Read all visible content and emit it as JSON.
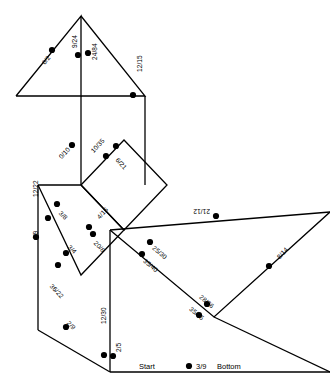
{
  "figure": {
    "stroke_color": "#000000",
    "fill_color": "#ffffff",
    "dot_color": "#000000",
    "width": 330,
    "height": 383
  },
  "polylines": [
    {
      "name": "top-large-triangle-left",
      "points": "16,96 81,16 81,96 16,96"
    },
    {
      "name": "top-large-triangle-right",
      "points": "81,16 145,96 81,96"
    },
    {
      "name": "neck-vertical-left",
      "points": "81,96 81,185"
    },
    {
      "name": "neck-vertical-right",
      "points": "145,96 145,185"
    },
    {
      "name": "body-diamond",
      "points": "81,185 124,140 167,185 124,230 81,185"
    },
    {
      "name": "left-parallelogram",
      "points": "38,185 81,185 124,230 81,275 38,185"
    },
    {
      "name": "left-vertical",
      "points": "38,185 38,330"
    },
    {
      "name": "bottom-left-edge",
      "points": "38,330 110,372"
    },
    {
      "name": "bottom-baseline",
      "points": "110,372 330,372"
    },
    {
      "name": "body-vertical-center",
      "points": "110,230 110,372"
    },
    {
      "name": "right-wing-top",
      "points": "110,230 330,212"
    },
    {
      "name": "right-wing-diagonal",
      "points": "110,230 214,317 330,212"
    },
    {
      "name": "right-lower-edge",
      "points": "214,317 330,372"
    }
  ],
  "labels": [
    {
      "name": "label-6-2",
      "text": "6/2",
      "x": 41,
      "y": 62,
      "rot": -52,
      "dot_x": 52,
      "dot_y": 50
    },
    {
      "name": "label-9-24",
      "text": "9/24",
      "x": 72,
      "y": 48,
      "rot": -90,
      "dot_x": 78,
      "dot_y": 55
    },
    {
      "name": "label-24-84",
      "text": "24/84",
      "x": 92,
      "y": 60,
      "rot": -90,
      "dot_x": 88,
      "dot_y": 53
    },
    {
      "name": "label-12-15",
      "text": "12/15",
      "x": 137,
      "y": 72,
      "rot": -90,
      "dot_x": 133,
      "dot_y": 95
    },
    {
      "name": "label-0-10",
      "text": "0/10",
      "x": 58,
      "y": 156,
      "rot": -48,
      "dot_x": 72,
      "dot_y": 145
    },
    {
      "name": "label-10-35",
      "text": "10/35",
      "x": 90,
      "y": 150,
      "rot": -48,
      "dot_x": 106,
      "dot_y": 156
    },
    {
      "name": "label-6-21",
      "text": "6/21",
      "x": 119,
      "y": 157,
      "rot": 48,
      "dot_x": 116,
      "dot_y": 146
    },
    {
      "name": "label-12-22",
      "text": "12/22",
      "x": 33,
      "y": 197,
      "rot": -90,
      "dot_x": 48,
      "dot_y": 218
    },
    {
      "name": "label-3-8",
      "text": "3/8",
      "x": 62,
      "y": 210,
      "rot": 47,
      "dot_x": 57,
      "dot_y": 204
    },
    {
      "name": "label-4-16",
      "text": "4/16",
      "x": 96,
      "y": 216,
      "rot": -47,
      "dot_x": 89,
      "dot_y": 227
    },
    {
      "name": "label-4-9",
      "text": "4/9",
      "x": 33,
      "y": 240,
      "rot": -90,
      "dot_x": 36,
      "dot_y": 237
    },
    {
      "name": "label-3-4",
      "text": "3/4",
      "x": 71,
      "y": 244,
      "rot": 47,
      "dot_x": 66,
      "dot_y": 253
    },
    {
      "name": "label-20-8",
      "text": "20/8",
      "x": 97,
      "y": 240,
      "rot": 47,
      "dot_x": 93,
      "dot_y": 234
    },
    {
      "name": "label-36-22",
      "text": "36/22",
      "x": 53,
      "y": 283,
      "rot": 47,
      "dot_x": 58,
      "dot_y": 265
    },
    {
      "name": "label-2-9",
      "text": "2/9",
      "x": 70,
      "y": 320,
      "rot": 47,
      "dot_x": 66,
      "dot_y": 327
    },
    {
      "name": "label-12-30",
      "text": "12/30",
      "x": 101,
      "y": 324,
      "rot": -90,
      "dot_x": 104,
      "dot_y": 355
    },
    {
      "name": "label-2-5",
      "text": "2/5",
      "x": 116,
      "y": 352,
      "rot": -90,
      "dot_x": 113,
      "dot_y": 356
    },
    {
      "name": "label-21-12",
      "text": "21/12",
      "x": 210,
      "y": 214,
      "rot": 180,
      "dot_x": 216,
      "dot_y": 216
    },
    {
      "name": "label-8-14",
      "text": "8/14",
      "x": 276,
      "y": 256,
      "rot": -47,
      "dot_x": 269,
      "dot_y": 266
    },
    {
      "name": "label-25-30",
      "text": "25/30",
      "x": 155,
      "y": 245,
      "rot": 40,
      "dot_x": 150,
      "dot_y": 242
    },
    {
      "name": "label-35-40",
      "text": "35/40",
      "x": 146,
      "y": 258,
      "rot": 40,
      "dot_x": 142,
      "dot_y": 254
    },
    {
      "name": "label-28-36",
      "text": "28/36",
      "x": 202,
      "y": 294,
      "rot": 40,
      "dot_x": 207,
      "dot_y": 304
    },
    {
      "name": "label-35-45",
      "text": "35/45",
      "x": 192,
      "y": 306,
      "rot": 40,
      "dot_x": 199,
      "dot_y": 315
    }
  ],
  "annotations": [
    {
      "name": "start-label",
      "text": "Start",
      "x": 139,
      "y": 363,
      "dot_x": null,
      "dot_y": null
    },
    {
      "name": "bottom-label",
      "text": "Bottom",
      "x": 217,
      "y": 363,
      "dot_x": null,
      "dot_y": null
    },
    {
      "name": "label-3-9",
      "text": "3/9",
      "x": 196,
      "y": 363,
      "dot_x": 189,
      "dot_y": 366
    }
  ]
}
